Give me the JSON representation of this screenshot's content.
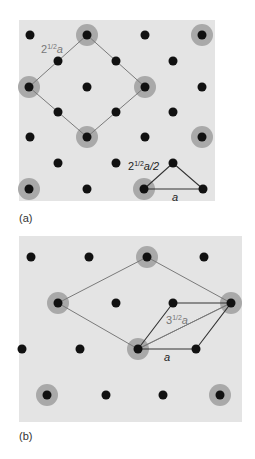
{
  "colors": {
    "panel_background": "#e4e4e4",
    "lattice_dot": "#111111",
    "highlight_ring": "#a9a9a9",
    "supercell_line": "#7a7a7a",
    "unitcell_line": "#333333",
    "label_gray": "#777777",
    "label_dark": "#222222"
  },
  "panels": [
    {
      "id": "a",
      "label": "(a)",
      "label_pos": [
        19,
        212
      ],
      "background": {
        "x": 19,
        "y": 20,
        "w": 196,
        "h": 181
      },
      "dots": [
        [
          30,
          35
        ],
        [
          87,
          35
        ],
        [
          145,
          35
        ],
        [
          202,
          35
        ],
        [
          58,
          61
        ],
        [
          116,
          61
        ],
        [
          173,
          61
        ],
        [
          29,
          87
        ],
        [
          87,
          87
        ],
        [
          145,
          87
        ],
        [
          202,
          87
        ],
        [
          58,
          112
        ],
        [
          116,
          112
        ],
        [
          173,
          112
        ],
        [
          30,
          137
        ],
        [
          87,
          137
        ],
        [
          145,
          137
        ],
        [
          202,
          137
        ],
        [
          58,
          163
        ],
        [
          116,
          163
        ],
        [
          173,
          163
        ],
        [
          29,
          189
        ],
        [
          87,
          189
        ],
        [
          144,
          189
        ],
        [
          203,
          189
        ]
      ],
      "highlighted": [
        [
          87,
          35
        ],
        [
          202,
          35
        ],
        [
          29,
          87
        ],
        [
          145,
          87
        ],
        [
          87,
          137
        ],
        [
          202,
          137
        ],
        [
          29,
          189
        ],
        [
          144,
          189
        ]
      ],
      "supercell": {
        "points": [
          [
            87,
            35
          ],
          [
            145,
            87
          ],
          [
            87,
            137
          ],
          [
            29,
            87
          ]
        ],
        "label": "2",
        "label_sup": "1/2",
        "label_tail": "a",
        "label_pos": [
          41,
          53
        ]
      },
      "triangle": {
        "points": [
          [
            144,
            189
          ],
          [
            173,
            163
          ],
          [
            203,
            189
          ]
        ],
        "label_hyp": "2",
        "label_hyp_sup": "1/2",
        "label_hyp_tail": "a/2",
        "label_hyp_pos": [
          128,
          170
        ],
        "label_base": "a",
        "label_base_pos": [
          172,
          201
        ]
      }
    },
    {
      "id": "b",
      "label": "(b)",
      "label_pos": [
        19,
        430
      ],
      "background": {
        "x": 19,
        "y": 236,
        "w": 223,
        "h": 186
      },
      "dots": [
        [
          31,
          257
        ],
        [
          89,
          257
        ],
        [
          147,
          257
        ],
        [
          204,
          257
        ],
        [
          58,
          303
        ],
        [
          116,
          303
        ],
        [
          173,
          303
        ],
        [
          231,
          303
        ],
        [
          22,
          349
        ],
        [
          80,
          349
        ],
        [
          138,
          349
        ],
        [
          196,
          349
        ],
        [
          47,
          395
        ],
        [
          106,
          395
        ],
        [
          163,
          395
        ],
        [
          220,
          395
        ]
      ],
      "highlighted": [
        [
          147,
          257
        ],
        [
          58,
          303
        ],
        [
          231,
          303
        ],
        [
          138,
          349
        ],
        [
          47,
          395
        ],
        [
          220,
          395
        ]
      ],
      "supercell": {
        "points": [
          [
            58,
            303
          ],
          [
            147,
            257
          ],
          [
            231,
            303
          ],
          [
            138,
            349
          ]
        ]
      },
      "unitcell": {
        "points": [
          [
            138,
            349
          ],
          [
            173,
            303
          ],
          [
            231,
            303
          ],
          [
            196,
            349
          ]
        ],
        "diagonal": [
          [
            138,
            349
          ],
          [
            231,
            303
          ]
        ],
        "label_diag": "3",
        "label_diag_sup": "1/2",
        "label_diag_tail": "a",
        "label_diag_pos": [
          166,
          324
        ],
        "label_base": "a",
        "label_base_pos": [
          164,
          361
        ]
      }
    }
  ]
}
